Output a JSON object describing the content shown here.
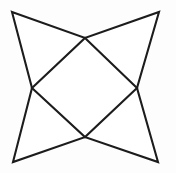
{
  "figure": {
    "name": "four-pointed-star",
    "canvas": {
      "width": 176,
      "height": 173,
      "background_color": "#fdfdfd"
    },
    "style": {
      "stroke_color": "#1c1c1c",
      "stroke_width": 2.1,
      "fill_color": "#ffffff"
    },
    "outer_points": [
      {
        "name": "top-left-point",
        "x": 12,
        "y": 12
      },
      {
        "name": "top-right-point",
        "x": 159,
        "y": 12
      },
      {
        "name": "bottom-right-point",
        "x": 158,
        "y": 162
      },
      {
        "name": "bottom-left-point",
        "x": 13,
        "y": 162
      }
    ],
    "inner_vertices": [
      {
        "name": "top-inner-vertex",
        "x": 85,
        "y": 38
      },
      {
        "name": "right-inner-vertex",
        "x": 137,
        "y": 88
      },
      {
        "name": "bottom-inner-vertex",
        "x": 85,
        "y": 137
      },
      {
        "name": "left-inner-vertex",
        "x": 32,
        "y": 88
      }
    ],
    "star_path_points": "12,12 85,38 159,12 137,88 158,162 85,137 13,162 32,88",
    "inner_quad_points": "85,38 137,88 85,137 32,88"
  }
}
